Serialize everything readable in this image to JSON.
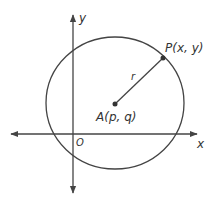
{
  "diagram": {
    "type": "coordinate-geometry",
    "colors": {
      "stroke": "#444444",
      "text": "#333333",
      "background": "#ffffff"
    },
    "axes": {
      "x_label": "x",
      "y_label": "y",
      "origin_label": "O"
    },
    "center": {
      "label": "A(p, q)"
    },
    "point": {
      "label": "P(x, y)"
    },
    "radius": {
      "label": "r"
    }
  }
}
